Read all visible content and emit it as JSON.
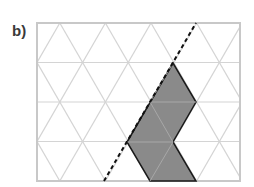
{
  "label": "b)",
  "grid": {
    "type": "isometric-triangular",
    "left": 37,
    "top": 23,
    "right": 240,
    "bottom": 181,
    "rows": 4,
    "row_height": 39.5,
    "triangle_side": 45.6,
    "line_color": "#d4d4d4",
    "border_color": "#c8c8c8"
  },
  "shape": {
    "fill": "#8a8a8a",
    "stroke": "#1a1a1a",
    "vertices": [
      [
        173,
        63
      ],
      [
        196,
        102
      ],
      [
        173,
        142
      ],
      [
        196,
        181
      ],
      [
        150,
        181
      ],
      [
        127,
        142
      ]
    ]
  },
  "symmetry_line": {
    "style": "dashed",
    "color": "#111111",
    "from": [
      104,
      181
    ],
    "to": [
      196,
      23
    ]
  }
}
